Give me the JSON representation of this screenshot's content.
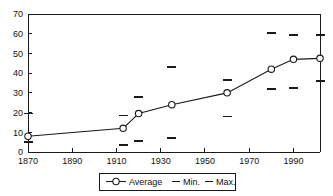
{
  "chart_data": {
    "type": "line",
    "title": "",
    "xlabel": "",
    "ylabel": "",
    "xlim": [
      1870,
      2002
    ],
    "ylim": [
      0,
      70
    ],
    "ytick_step": 10,
    "xtick_step": 20,
    "grid": false,
    "legend_position": "bottom",
    "xticks": [
      "1870",
      "1890",
      "1910",
      "1930",
      "1950",
      "1970",
      "1990"
    ],
    "xtick_values": [
      1870,
      1890,
      1910,
      1930,
      1950,
      1970,
      1990
    ],
    "yticks": [
      "0",
      "10",
      "20",
      "30",
      "40",
      "50",
      "60",
      "70"
    ],
    "ytick_values": [
      0,
      10,
      20,
      30,
      40,
      50,
      60,
      70
    ],
    "x": [
      1870,
      1913,
      1920,
      1935,
      1960,
      1980,
      1990,
      2002
    ],
    "series": [
      {
        "name": "Average",
        "marker": "circle-open",
        "values": [
          8,
          12,
          19.5,
          24,
          30,
          42,
          47,
          47.5
        ]
      },
      {
        "name": "Min.",
        "marker": "dash",
        "values": [
          5,
          3.5,
          5.5,
          7,
          18,
          32,
          32.5,
          36
        ]
      },
      {
        "name": "Max.",
        "marker": "dash",
        "values": [
          19.5,
          18.5,
          28,
          43,
          36.5,
          60.5,
          59.5,
          59.5
        ]
      }
    ],
    "legend": [
      {
        "label": "Average",
        "marker": "line-circle"
      },
      {
        "label": "Min.",
        "marker": "dash"
      },
      {
        "label": "Max.",
        "marker": "dash"
      }
    ],
    "colors": {
      "line": "#1a1a1a",
      "marker_fill": "#ffffff",
      "axis": "#1a1a1a",
      "text": "#111111",
      "background": "#ffffff"
    }
  }
}
